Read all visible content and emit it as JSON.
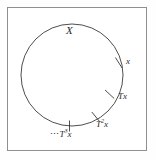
{
  "figure": {
    "type": "math-diagram",
    "background_color": "#ffffff",
    "frame_color": "#8f8f8f",
    "stroke_color": "#3a3a3a",
    "circle": {
      "center_x": 72,
      "center_y": 75,
      "radius": 51
    },
    "labels": {
      "space": "X",
      "point": "x",
      "image1": "T",
      "image1_arg": "x",
      "image2_base": "T",
      "image2_exp": "2",
      "image2_arg": "x",
      "image3_dots": "⋯",
      "image3_base": "T",
      "image3_exp": "3",
      "image3_arg": "x"
    },
    "tick_marks": [
      {
        "name": "tick-x",
        "angle_deg": -15,
        "label": "x"
      },
      {
        "name": "tick-Tx",
        "angle_deg": -48,
        "label": "Tx"
      },
      {
        "name": "tick-T2x",
        "angle_deg": -70,
        "label": "T2x"
      },
      {
        "name": "tick-T3x",
        "angle_deg": -93,
        "label": "T3x"
      }
    ]
  }
}
